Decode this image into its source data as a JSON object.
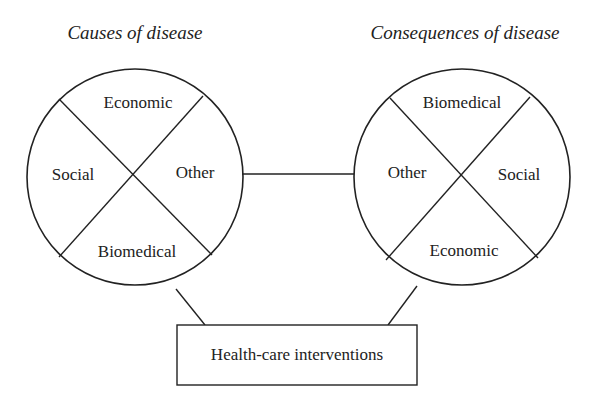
{
  "diagram": {
    "left": {
      "title": "Causes of disease",
      "quadrants": {
        "top": "Economic",
        "left": "Social",
        "right": "Other",
        "bottom": "Biomedical"
      }
    },
    "right": {
      "title": "Consequences of disease",
      "quadrants": {
        "top": "Biomedical",
        "left": "Other",
        "right": "Social",
        "bottom": "Economic"
      }
    },
    "box": {
      "label": "Health-care interventions"
    },
    "colors": {
      "stroke": "#222222",
      "background": "#ffffff"
    }
  }
}
